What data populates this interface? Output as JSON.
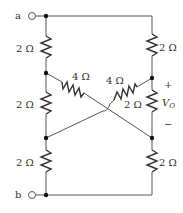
{
  "diagram": {
    "type": "circuit",
    "terminals": {
      "a": "a",
      "b": "b"
    },
    "resistors": {
      "left_top": "2 Ω",
      "left_mid": "2 Ω",
      "left_bottom": "2 Ω",
      "right_top": "2 Ω",
      "right_mid": "2 Ω",
      "right_bottom": "2 Ω",
      "cross_left": "4 Ω",
      "cross_right": "4 Ω"
    },
    "output": {
      "label": "V",
      "subscript": "O",
      "plus": "+",
      "minus": "−"
    }
  }
}
